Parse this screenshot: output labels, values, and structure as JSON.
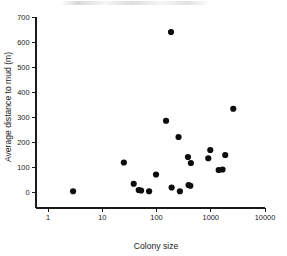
{
  "figure": {
    "background_color": "#ffffff",
    "marker_color": "#0d0d0d",
    "axis_color": "#1a1a1a"
  },
  "chart_data": {
    "type": "scatter",
    "title": "",
    "xlabel": "Colony size",
    "ylabel": "Average distance to mud (m)",
    "xscale": "log",
    "yscale": "linear",
    "xlim": [
      1,
      10000
    ],
    "ylim": [
      0,
      700
    ],
    "xticks": [
      1,
      10,
      100,
      1000,
      10000
    ],
    "xtick_labels": [
      "1",
      "10",
      "100",
      "1000",
      "10000"
    ],
    "yticks": [
      0,
      100,
      200,
      300,
      400,
      500,
      600,
      700
    ],
    "ytick_labels": [
      "0",
      "100",
      "200",
      "300",
      "400",
      "500",
      "600",
      "700"
    ],
    "grid": false,
    "legend": false,
    "series": [
      {
        "name": "colonies",
        "marker": "filled-circle",
        "points": [
          {
            "x": 2.9,
            "y": 3
          },
          {
            "x": 25,
            "y": 118
          },
          {
            "x": 38,
            "y": 33
          },
          {
            "x": 47,
            "y": 8
          },
          {
            "x": 52,
            "y": 6
          },
          {
            "x": 73,
            "y": 3
          },
          {
            "x": 98,
            "y": 70
          },
          {
            "x": 150,
            "y": 285
          },
          {
            "x": 185,
            "y": 640
          },
          {
            "x": 190,
            "y": 18
          },
          {
            "x": 255,
            "y": 220
          },
          {
            "x": 270,
            "y": 3
          },
          {
            "x": 380,
            "y": 140
          },
          {
            "x": 390,
            "y": 28
          },
          {
            "x": 420,
            "y": 25
          },
          {
            "x": 430,
            "y": 116
          },
          {
            "x": 900,
            "y": 135
          },
          {
            "x": 980,
            "y": 168
          },
          {
            "x": 1400,
            "y": 88
          },
          {
            "x": 1650,
            "y": 90
          },
          {
            "x": 1850,
            "y": 148
          },
          {
            "x": 2600,
            "y": 333
          }
        ]
      }
    ]
  },
  "axes_geometry": {
    "x_pixel_at_xmin": 48,
    "x_pixel_at_xmax": 265,
    "y_pixel_at_ymin": 192,
    "y_pixel_at_ymax": 17,
    "marker_radius_px": 3.1,
    "tick_length_px": 4,
    "x_axis_baseline_y": 208,
    "y_axis_baseline_x": 36
  }
}
